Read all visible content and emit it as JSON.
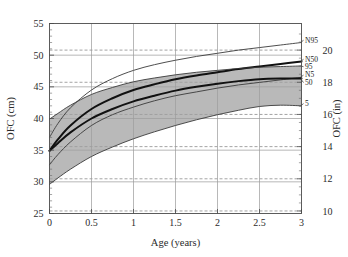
{
  "chart_data": {
    "type": "line",
    "title": "",
    "xlabel": "Age (years)",
    "ylabel": "OFC (cm)",
    "y2label": "OFC (in)",
    "xlim": [
      0,
      3
    ],
    "ylim": [
      25,
      55
    ],
    "y2lim": [
      9.84,
      21.65
    ],
    "xticks": [
      0,
      0.5,
      1,
      1.5,
      2,
      2.5,
      3
    ],
    "xticklabels": [
      "0",
      "0.5",
      "1",
      "1.5",
      "2",
      "2.5",
      "3"
    ],
    "yticks": [
      25,
      30,
      35,
      40,
      45,
      50,
      55
    ],
    "yticklabels": [
      "25",
      "30",
      "35",
      "40",
      "45",
      "50",
      "55"
    ],
    "y2ticks": [
      10,
      12,
      14,
      16,
      18,
      20
    ],
    "y2ticklabels": [
      "10",
      "12",
      "14",
      "16",
      "18",
      "20"
    ],
    "grid": "both-axes: solid horizontal lines at cm ticks, dashed horizontal lines at inch ticks, solid vertical lines at age ticks",
    "legend_position": "inline labels at right end of each curve",
    "band": {
      "label": "shaded area between 5th and 95th percentile study curves",
      "color": "#9e9e9e",
      "lower_series": "5",
      "upper_series": "95"
    },
    "x": [
      0,
      0.1,
      0.25,
      0.5,
      0.75,
      1.0,
      1.25,
      1.5,
      1.75,
      2.0,
      2.25,
      2.5,
      2.75,
      3.0
    ],
    "series": [
      {
        "name": "N95",
        "label": "N95",
        "style": "thin",
        "values": [
          37.0,
          39.2,
          41.7,
          44.5,
          46.3,
          47.6,
          48.5,
          49.2,
          49.8,
          50.3,
          50.8,
          51.2,
          51.6,
          52.0
        ]
      },
      {
        "name": "N50",
        "label": "N50",
        "style": "thick",
        "values": [
          34.9,
          36.7,
          38.9,
          41.5,
          43.2,
          44.5,
          45.4,
          46.2,
          46.8,
          47.3,
          47.8,
          48.2,
          48.6,
          49.0
        ]
      },
      {
        "name": "95",
        "label": "95",
        "style": "thin",
        "values": [
          39.9,
          40.8,
          42.1,
          43.8,
          44.9,
          45.8,
          46.4,
          46.9,
          47.3,
          47.6,
          47.9,
          48.1,
          48.2,
          48.3
        ]
      },
      {
        "name": "N5",
        "label": "N5",
        "style": "thin",
        "values": [
          32.7,
          34.3,
          36.3,
          38.9,
          40.6,
          41.8,
          42.8,
          43.6,
          44.2,
          44.8,
          45.3,
          45.7,
          46.1,
          46.5
        ]
      },
      {
        "name": "50",
        "label": "50",
        "style": "thick",
        "values": [
          34.9,
          36.1,
          37.8,
          40.0,
          41.5,
          42.7,
          43.6,
          44.4,
          45.0,
          45.5,
          45.9,
          46.2,
          46.3,
          46.3
        ]
      },
      {
        "name": "5",
        "label": "5",
        "style": "thin",
        "values": [
          29.6,
          30.6,
          32.0,
          34.0,
          35.5,
          36.8,
          37.9,
          38.9,
          39.8,
          40.6,
          41.3,
          41.9,
          42.1,
          42.0
        ]
      }
    ]
  }
}
